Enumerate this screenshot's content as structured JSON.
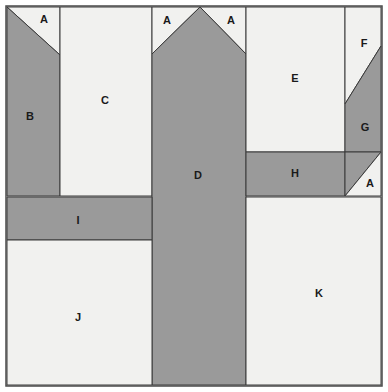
{
  "figure": {
    "width": 388,
    "height": 392,
    "background_color": "#ffffff",
    "outline_color": "#3a3a3a",
    "frame": {
      "x": 6,
      "y": 6,
      "width": 376,
      "height": 380
    }
  },
  "palette": {
    "light_fill": "#f1f1ef",
    "dark_fill": "#9a9a9a",
    "stroke": "#3a3a3a",
    "label_color": "#1a1a1a"
  },
  "regions": [
    {
      "id": "A1",
      "label": "A",
      "fill": "light",
      "points": "7,7 60,7 60,55 7,7",
      "label_x": 44,
      "label_y": 20
    },
    {
      "id": "B",
      "label": "B",
      "fill": "dark",
      "points": "7,7 60,55 60,196 7,196",
      "label_x": 30,
      "label_y": 117
    },
    {
      "id": "C",
      "label": "C",
      "fill": "light",
      "points": "60,7 152,7 152,196 60,196",
      "label_x": 105,
      "label_y": 101
    },
    {
      "id": "A2",
      "label": "A",
      "fill": "light",
      "points": "152,7 200,7 152,54",
      "label_x": 167,
      "label_y": 21
    },
    {
      "id": "A3",
      "label": "A",
      "fill": "light",
      "points": "200,7 246,7 246,54",
      "label_x": 231,
      "label_y": 21
    },
    {
      "id": "D",
      "label": "D",
      "fill": "dark",
      "points": "200,7 246,54 246,385 152,385 152,54",
      "label_x": 198,
      "label_y": 176
    },
    {
      "id": "E",
      "label": "E",
      "fill": "light",
      "points": "246,7 345,7 345,152 246,152",
      "label_x": 295,
      "label_y": 79
    },
    {
      "id": "F",
      "label": "F",
      "fill": "light",
      "points": "345,7 381,7 381,46 345,104",
      "label_x": 364,
      "label_y": 44
    },
    {
      "id": "G",
      "label": "G",
      "fill": "dark",
      "points": "381,46 381,152 345,152 345,104",
      "label_x": 365,
      "label_y": 128
    },
    {
      "id": "H",
      "label": "H",
      "fill": "dark",
      "points": "246,152 345,152 345,196 246,196",
      "label_x": 295,
      "label_y": 174
    },
    {
      "id": "G2",
      "label": "",
      "fill": "dark",
      "points": "345,152 381,152 345,196",
      "label_x": 0,
      "label_y": 0
    },
    {
      "id": "A4",
      "label": "A",
      "fill": "light",
      "points": "381,152 381,196 345,196",
      "label_x": 370,
      "label_y": 184
    },
    {
      "id": "I",
      "label": "I",
      "fill": "dark",
      "points": "7,197 152,197 152,240 7,240",
      "label_x": 78,
      "label_y": 221
    },
    {
      "id": "J",
      "label": "J",
      "fill": "light",
      "points": "7,240 152,240 152,385 7,385",
      "label_x": 78,
      "label_y": 318
    },
    {
      "id": "K",
      "label": "K",
      "fill": "light",
      "points": "246,197 381,197 381,385 246,385",
      "label_x": 319,
      "label_y": 294
    }
  ]
}
